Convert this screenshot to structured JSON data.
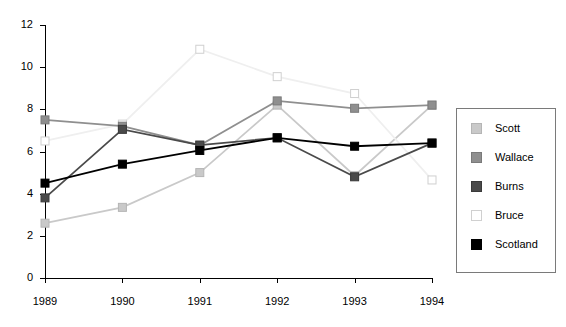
{
  "chart_data": {
    "type": "line",
    "title": "",
    "xlabel": "",
    "ylabel": "",
    "categories": [
      "1989",
      "1990",
      "1991",
      "1992",
      "1993",
      "1994"
    ],
    "x_tick_labels": [
      "1989",
      "1990",
      "1991",
      "1992",
      "1993",
      "1994"
    ],
    "y_tick_labels": [
      "0",
      "2",
      "4",
      "6",
      "8",
      "10",
      "12"
    ],
    "y_ticks": [
      0,
      2,
      4,
      6,
      8,
      10,
      12
    ],
    "ylim": [
      0,
      12
    ],
    "grid": false,
    "legend_position": "right",
    "marker": "square",
    "series": [
      {
        "name": "Scott",
        "color": "#c9c9c9",
        "marker_fill": "#c9c9c9",
        "marker_edge": "#b5b5b5",
        "values": [
          2.6,
          3.35,
          5.0,
          8.2,
          4.85,
          8.2
        ]
      },
      {
        "name": "Wallace",
        "color": "#8f8f8f",
        "marker_fill": "#8f8f8f",
        "marker_edge": "#7a7a7a",
        "values": [
          7.5,
          7.2,
          6.3,
          8.4,
          8.05,
          8.2
        ]
      },
      {
        "name": "Burns",
        "color": "#4a4a4a",
        "marker_fill": "#4a4a4a",
        "marker_edge": "#3a3a3a",
        "values": [
          3.8,
          7.05,
          6.3,
          6.65,
          4.8,
          6.4
        ]
      },
      {
        "name": "Bruce",
        "color": "#efefef",
        "marker_fill": "#ffffff",
        "marker_edge": "#d0d0d0",
        "values": [
          6.5,
          7.3,
          10.85,
          9.55,
          8.75,
          4.65
        ]
      },
      {
        "name": "Scotland",
        "color": "#000000",
        "marker_fill": "#000000",
        "marker_edge": "#000000",
        "values": [
          4.5,
          5.4,
          6.05,
          6.65,
          6.25,
          6.4
        ]
      }
    ]
  },
  "legend": {
    "items": [
      {
        "label": "Scott"
      },
      {
        "label": "Wallace"
      },
      {
        "label": "Burns"
      },
      {
        "label": "Bruce"
      },
      {
        "label": "Scotland"
      }
    ]
  }
}
